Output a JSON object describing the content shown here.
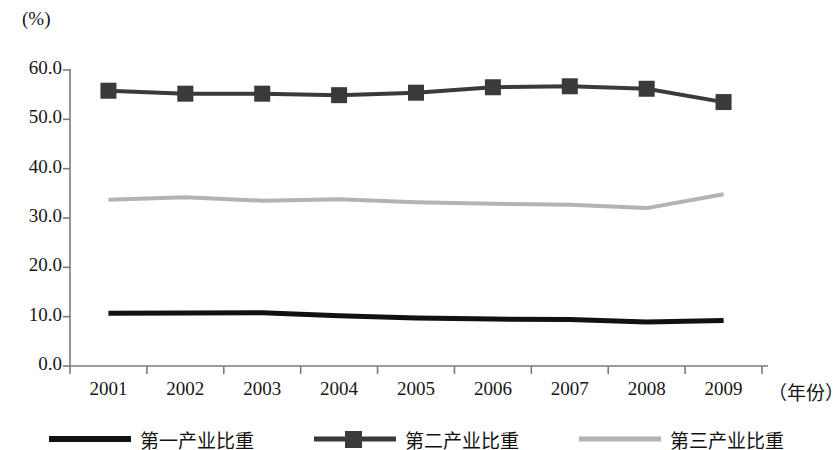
{
  "chart_data": {
    "type": "line",
    "title": "",
    "subtitle": "",
    "ylabel": "(%)",
    "xlabel": "（年份）",
    "categories": [
      "2001",
      "2002",
      "2003",
      "2004",
      "2005",
      "2006",
      "2007",
      "2008",
      "2009"
    ],
    "ylim": [
      0,
      60
    ],
    "yticks": [
      "0.0",
      "10.0",
      "20.0",
      "30.0",
      "40.0",
      "50.0",
      "60.0"
    ],
    "ytick_values": [
      0,
      10,
      20,
      30,
      40,
      50,
      60
    ],
    "grid": false,
    "legend_position": "bottom",
    "series": [
      {
        "name": "第一产业比重",
        "color": "#111111",
        "marker": "none",
        "line_width": 5,
        "values": [
          10.7,
          10.75,
          10.8,
          10.2,
          9.7,
          9.5,
          9.4,
          8.9,
          9.2
        ]
      },
      {
        "name": "第二产业比重",
        "color": "#3a3a3a",
        "marker": "square",
        "line_width": 4,
        "values": [
          55.8,
          55.2,
          55.2,
          54.9,
          55.4,
          56.5,
          56.7,
          56.2,
          53.5
        ]
      },
      {
        "name": "第三产业比重",
        "color": "#b3b3b3",
        "marker": "none",
        "line_width": 4,
        "values": [
          33.7,
          34.2,
          33.5,
          33.8,
          33.2,
          32.9,
          32.7,
          32.0,
          34.8
        ]
      }
    ]
  },
  "axis": {
    "unit_top": "(%)",
    "unit_right": "（年份）",
    "axis_color": "#7a7a7a"
  },
  "legend": {
    "items": [
      {
        "label": "第一产业比重",
        "style": "solid-thick-black"
      },
      {
        "label": "第二产业比重",
        "style": "solid-square-marker"
      },
      {
        "label": "第三产业比重",
        "style": "solid-light-gray"
      }
    ]
  }
}
